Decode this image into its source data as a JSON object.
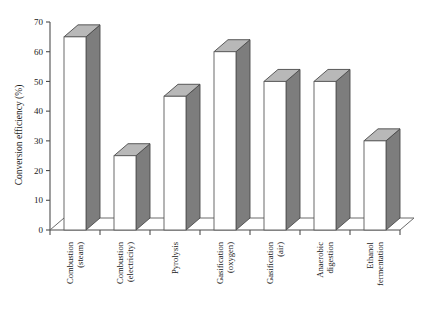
{
  "chart_data": {
    "type": "bar",
    "title": "",
    "subtitle": "",
    "xlabel": "",
    "ylabel": "Conversion efficiency (%)",
    "ylim": [
      0,
      70
    ],
    "ytick_step": 10,
    "yticks": [
      0,
      10,
      20,
      30,
      40,
      50,
      60,
      70
    ],
    "ytick_labels": [
      "0",
      "10",
      "20",
      "30",
      "40",
      "50",
      "60",
      "70"
    ],
    "grid": false,
    "legend": false,
    "legend_position": "none",
    "three_d": true,
    "categories": [
      "Combustion\n(steam)",
      "Combustion\n(electricity)",
      "Pyrolysis",
      "Gasification\n(oxygen)",
      "Gasification\n(air)",
      "Anaerobic\ndigestion",
      "Ethanol\nfermentation"
    ],
    "category_lines": [
      [
        "Combustion",
        "(steam)"
      ],
      [
        "Combustion",
        "(electricity)"
      ],
      [
        "Pyrolysis",
        ""
      ],
      [
        "Gasification",
        "(oxygen)"
      ],
      [
        "Gasification",
        "(air)"
      ],
      [
        "Anaerobic",
        "digestion"
      ],
      [
        "Ethanol",
        "fermentation"
      ]
    ],
    "values": [
      65,
      25,
      45,
      60,
      50,
      50,
      30
    ],
    "colors": {
      "bar_front": "#ffffff",
      "bar_side": "#7d7d7d",
      "bar_top": "#b8b8b8",
      "bar_edge": "#4a4a4a",
      "axis": "#4d4d4d",
      "text": "#1a1a1a",
      "background": "#ffffff"
    }
  },
  "axis": {
    "y_title": "Conversion efficiency (%)"
  }
}
